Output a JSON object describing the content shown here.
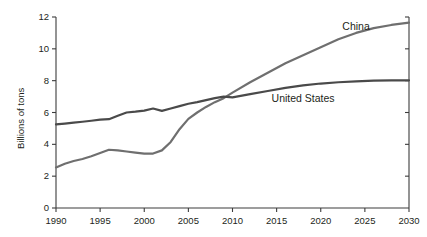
{
  "chart_data": {
    "type": "line",
    "title": "",
    "subtitle": "",
    "xlabel": "",
    "ylabel": "Billions of tons",
    "xlim": [
      1990,
      2030
    ],
    "ylim": [
      0,
      12
    ],
    "xticks": [
      1990,
      1995,
      2000,
      2005,
      2010,
      2015,
      2020,
      2025,
      2030
    ],
    "yticks": [
      0,
      2,
      4,
      6,
      8,
      10,
      12
    ],
    "xtick_labels": [
      "1990",
      "1995",
      "2000",
      "2005",
      "2010",
      "2015",
      "2020",
      "2025",
      "2030"
    ],
    "ytick_labels": [
      "0",
      "2",
      "4",
      "6",
      "8",
      "10",
      "12"
    ],
    "grid": false,
    "legend_position": "inline-annotation",
    "annotations": [
      {
        "text": "China",
        "x": 2024.0,
        "y": 11.35
      },
      {
        "text": "United States",
        "x": 2018.0,
        "y": 6.85
      }
    ],
    "series": [
      {
        "name": "China",
        "color": "#6f6f6f",
        "x": [
          1990,
          1991,
          1992,
          1993,
          1994,
          1995,
          1996,
          1997,
          1998,
          1999,
          2000,
          2001,
          2002,
          2003,
          2004,
          2005,
          2006,
          2007,
          2008,
          2009,
          2010,
          2012,
          2014,
          2016,
          2018,
          2020,
          2022,
          2024,
          2026,
          2028,
          2030
        ],
        "values": [
          2.55,
          2.78,
          2.95,
          3.08,
          3.25,
          3.45,
          3.66,
          3.62,
          3.55,
          3.48,
          3.42,
          3.42,
          3.62,
          4.15,
          4.95,
          5.6,
          6.0,
          6.35,
          6.65,
          6.9,
          7.25,
          7.9,
          8.5,
          9.1,
          9.6,
          10.1,
          10.6,
          11.0,
          11.3,
          11.5,
          11.65
        ]
      },
      {
        "name": "United States",
        "color": "#4a4a4a",
        "x": [
          1990,
          1991,
          1992,
          1993,
          1994,
          1995,
          1996,
          1997,
          1998,
          1999,
          2000,
          2001,
          2002,
          2003,
          2004,
          2005,
          2006,
          2007,
          2008,
          2009,
          2010,
          2012,
          2014,
          2016,
          2018,
          2020,
          2022,
          2024,
          2026,
          2028,
          2030
        ],
        "values": [
          5.25,
          5.3,
          5.36,
          5.42,
          5.48,
          5.55,
          5.58,
          5.8,
          6.0,
          6.05,
          6.12,
          6.25,
          6.1,
          6.25,
          6.4,
          6.55,
          6.65,
          6.78,
          6.9,
          7.0,
          6.95,
          7.15,
          7.35,
          7.55,
          7.7,
          7.82,
          7.9,
          7.96,
          8.0,
          8.02,
          8.02
        ]
      }
    ]
  },
  "layout": {
    "plot_left": 56,
    "plot_right": 409,
    "plot_top": 17,
    "plot_bottom": 208,
    "axis_color": "#3c3c3c"
  }
}
